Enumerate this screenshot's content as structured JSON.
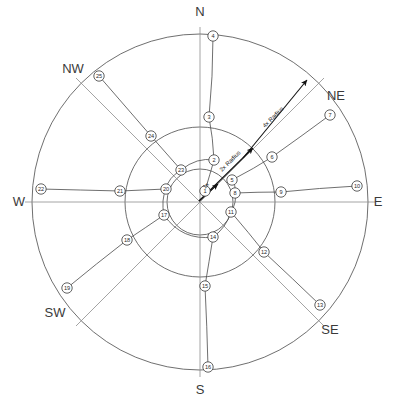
{
  "diagram": {
    "center": {
      "x": 200,
      "y": 202
    },
    "rings": [
      {
        "name": "inner",
        "radius": 33,
        "label": "1x Radius"
      },
      {
        "name": "middle",
        "radius": 75,
        "label": "2x Radius"
      },
      {
        "name": "outer",
        "radius": 168,
        "label": "4x Radius"
      }
    ],
    "compass": [
      {
        "label": "N",
        "x": 200,
        "y": 16,
        "anchor": "middle"
      },
      {
        "label": "NE",
        "x": 336,
        "y": 100,
        "anchor": "middle"
      },
      {
        "label": "E",
        "x": 378,
        "y": 206,
        "anchor": "middle"
      },
      {
        "label": "SE",
        "x": 330,
        "y": 334,
        "anchor": "middle"
      },
      {
        "label": "S",
        "x": 200,
        "y": 394,
        "anchor": "middle"
      },
      {
        "label": "SW",
        "x": 55,
        "y": 317,
        "anchor": "middle"
      },
      {
        "label": "W",
        "x": 19,
        "y": 206,
        "anchor": "middle"
      },
      {
        "label": "NW",
        "x": 73,
        "y": 73,
        "anchor": "middle"
      }
    ],
    "radius_annotations": [
      {
        "id": "1x",
        "text": "1x",
        "x": 205,
        "y": 189,
        "rotate": -45
      },
      {
        "id": "2x",
        "text": "2x Radius",
        "x": 222,
        "y": 172,
        "rotate": -45
      },
      {
        "id": "4x",
        "text": "4x Radius",
        "x": 265,
        "y": 128,
        "rotate": -45
      }
    ],
    "nodes": [
      {
        "n": 1,
        "ring": "center",
        "x": 205,
        "y": 191
      },
      {
        "n": 2,
        "ring": "inner",
        "x": 214,
        "y": 160
      },
      {
        "n": 3,
        "ring": "middle",
        "x": 209,
        "y": 117
      },
      {
        "n": 4,
        "ring": "outer",
        "x": 213,
        "y": 36
      },
      {
        "n": 5,
        "ring": "inner",
        "x": 232,
        "y": 180
      },
      {
        "n": 6,
        "ring": "middle",
        "x": 272,
        "y": 157
      },
      {
        "n": 7,
        "ring": "outer",
        "x": 330,
        "y": 115
      },
      {
        "n": 8,
        "ring": "inner",
        "x": 235,
        "y": 193
      },
      {
        "n": 9,
        "ring": "middle",
        "x": 281,
        "y": 192
      },
      {
        "n": 10,
        "ring": "outer",
        "x": 357,
        "y": 186
      },
      {
        "n": 11,
        "ring": "inner",
        "x": 231,
        "y": 212
      },
      {
        "n": 12,
        "ring": "middle",
        "x": 264,
        "y": 252
      },
      {
        "n": 13,
        "ring": "outer",
        "x": 320,
        "y": 305
      },
      {
        "n": 14,
        "ring": "inner",
        "x": 213,
        "y": 237
      },
      {
        "n": 15,
        "ring": "middle",
        "x": 205,
        "y": 286
      },
      {
        "n": 16,
        "ring": "outer",
        "x": 208,
        "y": 367
      },
      {
        "n": 17,
        "ring": "inner",
        "x": 164,
        "y": 215
      },
      {
        "n": 18,
        "ring": "middle",
        "x": 127,
        "y": 240
      },
      {
        "n": 19,
        "ring": "outer",
        "x": 67,
        "y": 288
      },
      {
        "n": 20,
        "ring": "inner",
        "x": 166,
        "y": 189
      },
      {
        "n": 21,
        "ring": "middle",
        "x": 120,
        "y": 191
      },
      {
        "n": 22,
        "ring": "outer",
        "x": 41,
        "y": 189
      },
      {
        "n": 23,
        "ring": "inner",
        "x": 181,
        "y": 170
      },
      {
        "n": 24,
        "ring": "middle",
        "x": 151,
        "y": 136
      },
      {
        "n": 25,
        "ring": "outer",
        "x": 99,
        "y": 76
      }
    ]
  }
}
